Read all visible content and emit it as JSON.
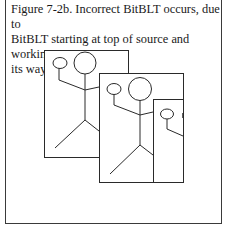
{
  "figure": {
    "caption": "Figure 7-2b. Incorrect BitBLT occurs, due to BitBLT starting at top of source and working its way down.",
    "caption_lines": [
      "Figure 7-2b. Incorrect BitBLT occurs, due to",
      "BitBLT starting at top of source and working",
      "its way down."
    ],
    "illustration": {
      "description": "Three overlapping rectangular frames each containing a stick figure, showing smeared copies from an incorrect BitBLT",
      "frames": [
        {
          "name": "source-frame",
          "x": 44,
          "y": 50,
          "w": 84,
          "h": 107
        },
        {
          "name": "first-copy-frame",
          "x": 99,
          "y": 73,
          "w": 84,
          "h": 109
        },
        {
          "name": "second-copy-frame",
          "x": 153,
          "y": 99,
          "w": 30,
          "h": 83
        }
      ],
      "line_color": "#2a2a2a"
    }
  }
}
